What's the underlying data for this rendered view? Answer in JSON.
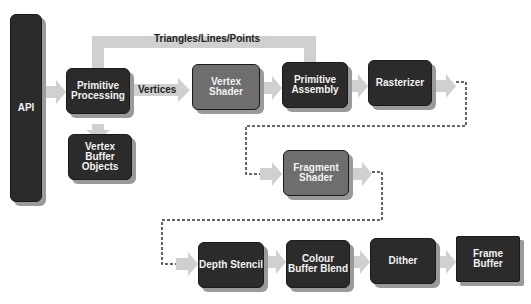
{
  "diagram": {
    "nodes": [
      {
        "id": "api",
        "label": "API"
      },
      {
        "id": "primitive_processing",
        "label": "Primitive Processing"
      },
      {
        "id": "vertex_buffer_objects",
        "label": "Vertex Buffer Objects"
      },
      {
        "id": "vertex_shader",
        "label": "Vertex Shader"
      },
      {
        "id": "primitive_assembly",
        "label": "Primitive Assembly"
      },
      {
        "id": "rasterizer",
        "label": "Rasterizer"
      },
      {
        "id": "fragment_shader",
        "label": "Fragment Shader"
      },
      {
        "id": "depth_stencil",
        "label": "Depth Stencil"
      },
      {
        "id": "colour_buffer_blend",
        "label": "Colour Buffer Blend"
      },
      {
        "id": "dither",
        "label": "Dither"
      },
      {
        "id": "frame_buffer",
        "label": "Frame Buffer"
      }
    ],
    "edge_labels": {
      "triangles": "Triangles/Lines/Points",
      "vertices": "Vertices"
    },
    "colors": {
      "dark_box": "#2b2b2b",
      "shader_box": "#6e6e6e",
      "arrow": "#d0d0d0",
      "dashed": "#333333"
    }
  }
}
